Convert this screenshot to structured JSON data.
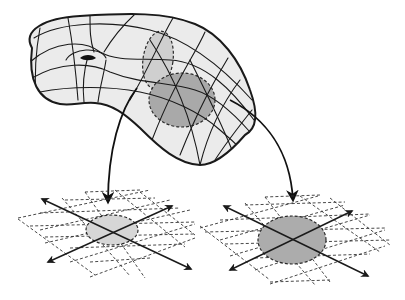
{
  "figure": {
    "colors": {
      "surface": "#ebebeb",
      "patch_light": "#cfcfcf",
      "patch_dark": "#a9a9a9",
      "outline": "#1a1a1a",
      "background": "#ffffff"
    },
    "elements": {
      "manifold": {
        "label": "manifold-surface",
        "has_hole": true
      },
      "patches": [
        {
          "label": "chart-region-1",
          "shade": "light"
        },
        {
          "label": "chart-region-2",
          "shade": "dark"
        }
      ],
      "maps": [
        {
          "label": "chart-map-1",
          "from": "chart-region-1",
          "to": "coordinate-plane-left"
        },
        {
          "label": "chart-map-2",
          "from": "chart-region-2",
          "to": "coordinate-plane-right"
        }
      ],
      "planes": [
        {
          "label": "coordinate-plane-left",
          "shade": "light"
        },
        {
          "label": "coordinate-plane-right",
          "shade": "dark"
        }
      ]
    }
  }
}
